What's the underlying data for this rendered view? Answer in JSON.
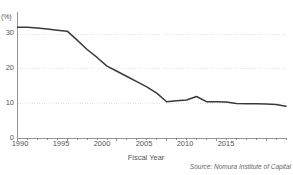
{
  "chart_data": {
    "type": "line",
    "title": "",
    "subtitle": "",
    "xlabel": "Fiscal Year",
    "ylabel": "",
    "unit_label": "(%)",
    "xlim": [
      1990,
      2017
    ],
    "ylim": [
      0,
      35
    ],
    "grid": "horizontal-dotted",
    "legend": "none",
    "ytick_labels": [
      "0",
      "10",
      "20",
      "30"
    ],
    "ytick_values": [
      0,
      10,
      20,
      30
    ],
    "xtick_labels": [
      "1990",
      "1995",
      "2000",
      "2005",
      "2010",
      "2015"
    ],
    "xtick_values": [
      1990,
      1995,
      2000,
      2005,
      2010,
      2015
    ],
    "line_color": "#3a3a3a",
    "grid_color": "#dcdcdc",
    "axis_color": "#7a7a7a",
    "background_color": "#ffffff",
    "x": [
      1990,
      1991,
      1992,
      1993,
      1994,
      1995,
      1996,
      1997,
      1998,
      1999,
      2000,
      2001,
      2002,
      2003,
      2004,
      2005,
      2006,
      2007,
      2008,
      2009,
      2010,
      2011,
      2012,
      2013,
      2014,
      2015,
      2016,
      2017
    ],
    "values": [
      32.0,
      32.0,
      31.8,
      31.5,
      31.2,
      30.9,
      28.3,
      25.6,
      23.3,
      20.8,
      19.3,
      17.8,
      16.3,
      14.8,
      13.0,
      10.5,
      10.8,
      11.0,
      12.0,
      10.5,
      10.5,
      10.4,
      10.0,
      9.9,
      9.9,
      9.8,
      9.7,
      9.2
    ],
    "series": [
      {
        "name": "share",
        "values": [
          32.0,
          32.0,
          31.8,
          31.5,
          31.2,
          30.9,
          28.3,
          25.6,
          23.3,
          20.8,
          19.3,
          17.8,
          16.3,
          14.8,
          13.0,
          10.5,
          10.8,
          11.0,
          12.0,
          10.5,
          10.5,
          10.4,
          10.0,
          9.9,
          9.9,
          9.8,
          9.7,
          9.2
        ]
      }
    ]
  },
  "source": {
    "text": "Source: Nomura Institute of Capital"
  }
}
